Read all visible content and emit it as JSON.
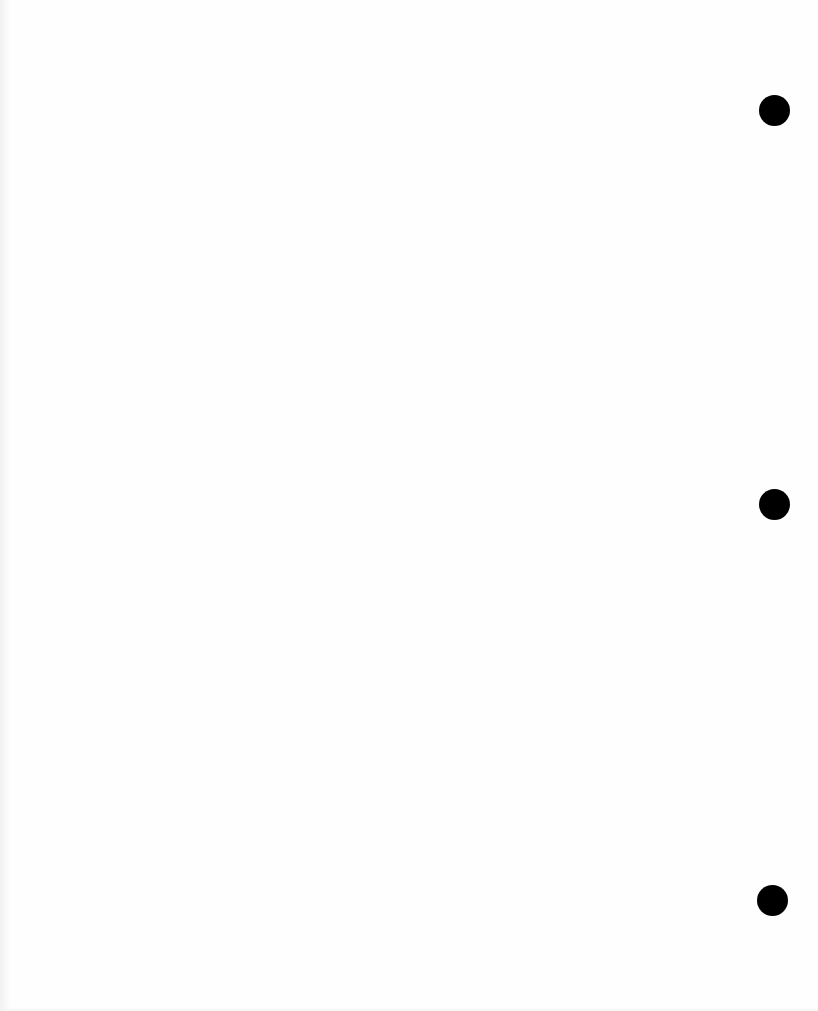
{
  "page": {
    "background_color": "#fefefe",
    "content": "",
    "punch_holes": [
      {
        "cx": 774,
        "cy": 110,
        "diameter": 31,
        "color": "#000000"
      },
      {
        "cx": 774,
        "cy": 504,
        "diameter": 31,
        "color": "#000000"
      },
      {
        "cx": 772,
        "cy": 900,
        "diameter": 31,
        "color": "#000000"
      }
    ]
  }
}
